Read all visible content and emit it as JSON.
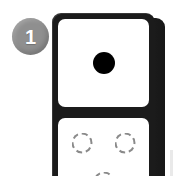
{
  "canvas": {
    "width": 178,
    "height": 176,
    "background_color": "#ffffff"
  },
  "badge": {
    "name": "step-badge",
    "label": "1",
    "shape": "circle",
    "fill_color": "#8f8f8f",
    "text_color": "#ffffff"
  },
  "domino": {
    "name": "domino-tile",
    "orientation": "vertical",
    "body_color": "#1b1b1b",
    "face_color": "#ffffff",
    "depth_color": "#2b2b2b",
    "has_3d_edge": true,
    "halves": [
      {
        "name": "top-half",
        "value": "1",
        "pip_style": "filled",
        "pip_color": "#000000",
        "pips": [
          {
            "name": "pip-center",
            "position": "center",
            "style": "filled"
          }
        ]
      },
      {
        "name": "bottom-half",
        "value": "3",
        "pip_style": "ghost",
        "pip_color": "#8a8a8a",
        "pips": [
          {
            "name": "pip-top-left",
            "position": "top-left",
            "style": "ghost"
          },
          {
            "name": "pip-top-right",
            "position": "top-right",
            "style": "ghost"
          },
          {
            "name": "pip-bottom-center",
            "position": "bottom-center",
            "style": "ghost"
          }
        ]
      }
    ]
  }
}
